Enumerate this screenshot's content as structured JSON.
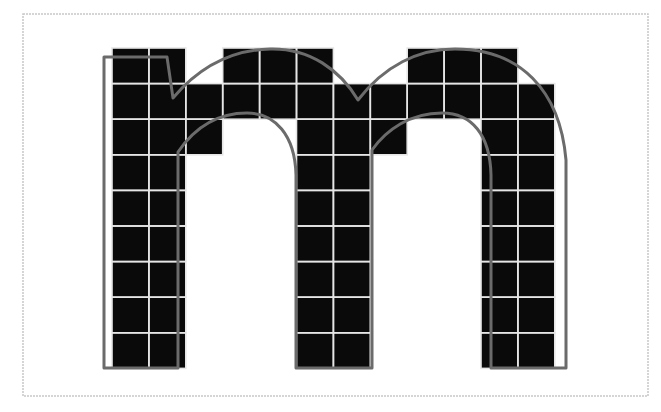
{
  "diagram": {
    "glyph": "m",
    "colors": {
      "background": "#ffffff",
      "frame": "#c8c8c8",
      "pixel_fill": "#0a0a0a",
      "grid_line": "#e6e6e6",
      "outline": "#6b6b6b"
    },
    "frame": {
      "x": 23,
      "y": 14,
      "width": 625,
      "height": 382
    },
    "grid": {
      "origin_x": 112,
      "origin_y": 48,
      "cols": 12,
      "rows": 9,
      "cell_w": 36.9,
      "cell_h": 35.6
    },
    "filled_cells": [
      [
        1,
        1,
        0,
        1,
        1,
        1,
        0,
        0,
        1,
        1,
        1,
        0
      ],
      [
        1,
        1,
        1,
        1,
        1,
        1,
        1,
        1,
        1,
        1,
        1,
        1
      ],
      [
        1,
        1,
        1,
        0,
        0,
        1,
        1,
        1,
        0,
        0,
        1,
        1
      ],
      [
        1,
        1,
        0,
        0,
        0,
        1,
        1,
        0,
        0,
        0,
        1,
        1
      ],
      [
        1,
        1,
        0,
        0,
        0,
        1,
        1,
        0,
        0,
        0,
        1,
        1
      ],
      [
        1,
        1,
        0,
        0,
        0,
        1,
        1,
        0,
        0,
        0,
        1,
        1
      ],
      [
        1,
        1,
        0,
        0,
        0,
        1,
        1,
        0,
        0,
        0,
        1,
        1
      ],
      [
        1,
        1,
        0,
        0,
        0,
        1,
        1,
        0,
        0,
        0,
        1,
        1
      ],
      [
        1,
        1,
        0,
        0,
        0,
        1,
        1,
        0,
        0,
        0,
        1,
        1
      ]
    ],
    "outline_path": "M104,368 L104,57 L167,57 L173,98 C200,66 232,50 270,49 C310,48 340,70 358,100 C384,66 418,49 455,49 C520,49 560,90 566,160 L566,368 L491,368 L491,175 C490,135 472,113 442,113 C410,113 386,130 372,150 L372,368 L296,368 L296,175 C295,135 275,113 247,113 C215,113 193,130 178,152 L178,368 Z"
  }
}
